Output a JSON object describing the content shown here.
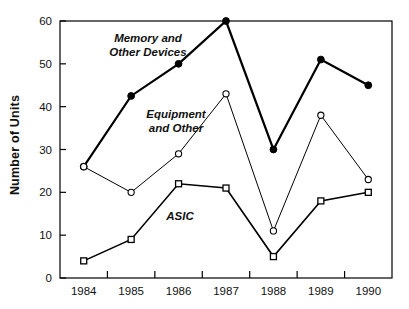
{
  "chart_data": {
    "type": "line",
    "title": "",
    "xlabel": "",
    "ylabel": "Number of Units",
    "categories": [
      "1984",
      "1985",
      "1986",
      "1987",
      "1988",
      "1989",
      "1990"
    ],
    "x": [
      1984,
      1985,
      1986,
      1987,
      1988,
      1989,
      1990
    ],
    "ylim": [
      0,
      60
    ],
    "yticks": [
      0,
      10,
      20,
      30,
      40,
      50,
      60
    ],
    "ytick_labels": [
      "0",
      "10",
      "20",
      "30",
      "40",
      "50",
      "60"
    ],
    "xtick_labels": [
      "1984",
      "1985",
      "1986",
      "1987",
      "1988",
      "1989",
      "1990"
    ],
    "grid": false,
    "legend_position": "inline-annotations",
    "series": [
      {
        "name": "Memory and Other Devices",
        "label_lines": [
          "Memory and",
          "Other Devices"
        ],
        "marker": "filled-circle",
        "line_width": 2.2,
        "color": "#000000",
        "values": [
          26,
          42.5,
          50,
          60,
          30,
          51,
          45
        ]
      },
      {
        "name": "Equipment and Other",
        "label_lines": [
          "Equipment",
          "and Other"
        ],
        "marker": "open-circle",
        "line_width": 1.0,
        "color": "#000000",
        "values": [
          26,
          20,
          29,
          43,
          11,
          38,
          23
        ]
      },
      {
        "name": "ASIC",
        "label_lines": [
          "ASIC"
        ],
        "marker": "open-square",
        "line_width": 1.6,
        "color": "#000000",
        "values": [
          4,
          9,
          22,
          21,
          5,
          18,
          20
        ]
      }
    ],
    "annotations": [
      {
        "text": "Memory and",
        "x_px": 148,
        "y_px": 42
      },
      {
        "text": "Other Devices",
        "x_px": 148,
        "y_px": 56
      },
      {
        "text": "Equipment",
        "x_px": 176,
        "y_px": 118
      },
      {
        "text": "and Other",
        "x_px": 176,
        "y_px": 132
      },
      {
        "text": "ASIC",
        "x_px": 180,
        "y_px": 220
      }
    ]
  },
  "axes": {
    "y_title": "Number of Units",
    "plot_left_px": 60,
    "plot_right_px": 392,
    "plot_top_px": 21,
    "plot_bottom_px": 278
  }
}
